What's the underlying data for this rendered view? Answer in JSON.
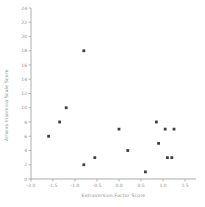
{
  "chart_data": {
    "type": "scatter",
    "title": "",
    "xlabel": "Extraversion Factor Score",
    "ylabel": "Athens Insomnia Scale Score",
    "xlim": [
      -2.0,
      1.5
    ],
    "ylim": [
      0,
      24
    ],
    "x_ticks": [
      -2.0,
      -1.5,
      -1.0,
      -0.5,
      0.0,
      0.5,
      1.0,
      1.5
    ],
    "x_tick_labels": [
      "-2.0",
      "-1.5",
      "-1.0",
      "-0.5",
      "0.0",
      "0.5",
      "1.0",
      "1.5"
    ],
    "y_ticks": [
      0,
      2,
      4,
      6,
      8,
      10,
      12,
      14,
      16,
      18,
      20,
      22,
      24
    ],
    "y_tick_labels": [
      "0",
      "2",
      "4",
      "6",
      "8",
      "10",
      "12",
      "14",
      "16",
      "18",
      "20",
      "22",
      "24"
    ],
    "grid": false,
    "legend": null,
    "marker": "square",
    "points": [
      {
        "x": -1.6,
        "y": 6
      },
      {
        "x": -1.35,
        "y": 8
      },
      {
        "x": -1.2,
        "y": 10
      },
      {
        "x": -0.8,
        "y": 18
      },
      {
        "x": -0.8,
        "y": 2
      },
      {
        "x": -0.55,
        "y": 3
      },
      {
        "x": 0.0,
        "y": 7
      },
      {
        "x": 0.2,
        "y": 4
      },
      {
        "x": 0.6,
        "y": 1
      },
      {
        "x": 0.85,
        "y": 8
      },
      {
        "x": 0.9,
        "y": 5
      },
      {
        "x": 1.05,
        "y": 7
      },
      {
        "x": 1.1,
        "y": 3
      },
      {
        "x": 1.2,
        "y": 3
      },
      {
        "x": 1.25,
        "y": 7
      }
    ]
  },
  "colors": {
    "background": "#ffffff",
    "axis": "#9a9a9a",
    "tick_label": "#8c8c8c",
    "axis_title": "#8c8c8c",
    "marker": "#3f3f3f"
  }
}
